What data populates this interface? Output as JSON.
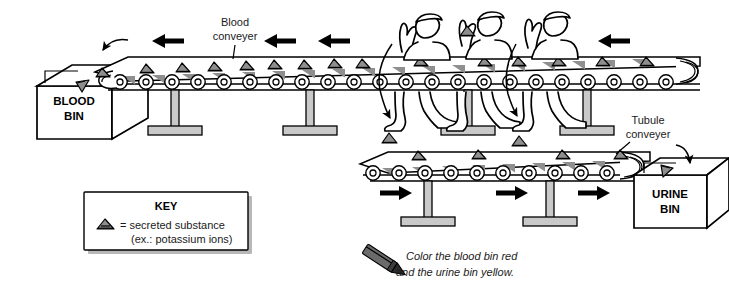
{
  "figure": {
    "title_alt": "Nephron secretion conveyer-belt analogy diagram",
    "labels": {
      "blood_conveyer": "Blood\nconveyer",
      "blood_conveyer_l1": "Blood",
      "blood_conveyer_l2": "conveyer",
      "tubule_conveyer_l1": "Tubule",
      "tubule_conveyer_l2": "conveyer",
      "blood_bin_l1": "BLOOD",
      "blood_bin_l2": "BIN",
      "urine_bin_l1": "URINE",
      "urine_bin_l2": "BIN"
    },
    "key": {
      "title": "KEY",
      "symbol_name": "secreted-substance-triangle",
      "line1": "= secreted substance",
      "line2": "(ex.: potassium ions)"
    },
    "instruction": {
      "icon": "pencil-icon",
      "line1": "Color the blood bin red",
      "line2": "and the urine bin yellow."
    },
    "flow": {
      "blood_direction": "left",
      "tubule_direction": "right",
      "blood_arrow_count": 4,
      "tubule_arrow_count": 3,
      "worker_count": 3,
      "transfer_arrow_count": 2
    },
    "colors": {
      "ink": "#000000",
      "substance_gray": "#8e8e8e",
      "leg_gray": "#c9c9c9",
      "shadow_gray": "#b8b8b8",
      "paper": "#ffffff"
    }
  }
}
